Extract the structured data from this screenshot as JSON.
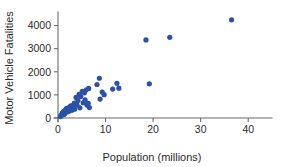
{
  "chart_data": {
    "type": "scatter",
    "title": "",
    "xlabel": "Population (millions)",
    "ylabel": "Motor Vehicle Fatalities",
    "xlim": [
      0,
      45
    ],
    "ylim": [
      0,
      4500
    ],
    "xticks": [
      0,
      10,
      20,
      30,
      40
    ],
    "yticks": [
      0,
      1000,
      2000,
      3000,
      4000
    ],
    "xticklabels": [
      "0",
      "10",
      "20",
      "30",
      "40"
    ],
    "yticklabels": [
      "0",
      "1000",
      "2000",
      "3000",
      "4000"
    ],
    "grid": false,
    "legend": false,
    "marker_color": "#2a52a8",
    "marker_size": 2.6,
    "axis_color": "#6b6b6b",
    "points": [
      {
        "x": 0.52,
        "y": 60
      },
      {
        "x": 0.64,
        "y": 110
      },
      {
        "x": 0.81,
        "y": 125
      },
      {
        "x": 0.87,
        "y": 200
      },
      {
        "x": 0.96,
        "y": 165
      },
      {
        "x": 1.05,
        "y": 230
      },
      {
        "x": 1.1,
        "y": 270
      },
      {
        "x": 1.26,
        "y": 150
      },
      {
        "x": 1.32,
        "y": 290
      },
      {
        "x": 1.4,
        "y": 195
      },
      {
        "x": 1.49,
        "y": 330
      },
      {
        "x": 1.6,
        "y": 245
      },
      {
        "x": 1.71,
        "y": 380
      },
      {
        "x": 1.78,
        "y": 300
      },
      {
        "x": 1.82,
        "y": 420
      },
      {
        "x": 1.95,
        "y": 265
      },
      {
        "x": 2.1,
        "y": 345
      },
      {
        "x": 2.28,
        "y": 455
      },
      {
        "x": 2.4,
        "y": 300
      },
      {
        "x": 2.55,
        "y": 390
      },
      {
        "x": 2.62,
        "y": 510
      },
      {
        "x": 2.8,
        "y": 430
      },
      {
        "x": 2.92,
        "y": 340
      },
      {
        "x": 3.05,
        "y": 545
      },
      {
        "x": 3.2,
        "y": 470
      },
      {
        "x": 3.45,
        "y": 640
      },
      {
        "x": 3.5,
        "y": 380
      },
      {
        "x": 3.8,
        "y": 890
      },
      {
        "x": 4.0,
        "y": 560
      },
      {
        "x": 4.2,
        "y": 760
      },
      {
        "x": 4.45,
        "y": 1020
      },
      {
        "x": 4.6,
        "y": 440
      },
      {
        "x": 4.8,
        "y": 930
      },
      {
        "x": 5.1,
        "y": 1150
      },
      {
        "x": 5.3,
        "y": 660
      },
      {
        "x": 5.55,
        "y": 1090
      },
      {
        "x": 5.7,
        "y": 780
      },
      {
        "x": 5.9,
        "y": 1210
      },
      {
        "x": 6.1,
        "y": 560
      },
      {
        "x": 6.35,
        "y": 630
      },
      {
        "x": 6.45,
        "y": 1280
      },
      {
        "x": 6.6,
        "y": 450
      },
      {
        "x": 8.2,
        "y": 1450
      },
      {
        "x": 8.7,
        "y": 1720
      },
      {
        "x": 8.85,
        "y": 820
      },
      {
        "x": 9.3,
        "y": 1120
      },
      {
        "x": 9.7,
        "y": 1010
      },
      {
        "x": 11.5,
        "y": 1250
      },
      {
        "x": 12.4,
        "y": 1500
      },
      {
        "x": 12.8,
        "y": 1290
      },
      {
        "x": 18.5,
        "y": 3380
      },
      {
        "x": 19.2,
        "y": 1480
      },
      {
        "x": 23.5,
        "y": 3490
      },
      {
        "x": 36.5,
        "y": 4250
      }
    ]
  }
}
